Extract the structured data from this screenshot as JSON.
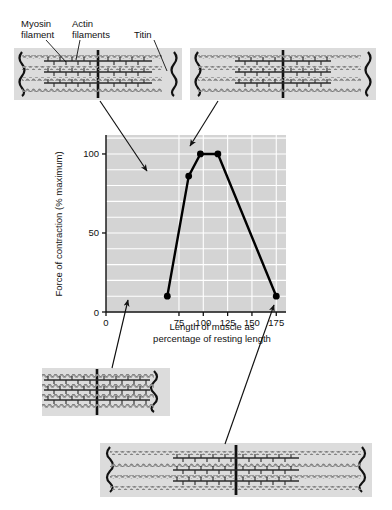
{
  "figure": {
    "labels": {
      "myosin": "Myosin\nfilament",
      "actin": "Actin\nfilaments",
      "titin": "Titin"
    }
  },
  "chart_data": {
    "type": "line",
    "title": "",
    "xlabel": "Length of muscle as\npercentage of resting length",
    "ylabel": "Force of contraction (% maximum)",
    "xlabel_line1": "Length of muscle as",
    "xlabel_line2": "percentage of resting length",
    "xlim": [
      0,
      185
    ],
    "ylim": [
      0,
      112
    ],
    "xticks": [
      0,
      75,
      100,
      125,
      150,
      175
    ],
    "xtick_labels": [
      "0",
      "75",
      "100",
      "125",
      "150",
      "175"
    ],
    "yticks": [
      0,
      50,
      100
    ],
    "ytick_labels": [
      "0",
      "50",
      "100"
    ],
    "grid": true,
    "legend": "none",
    "x": [
      63,
      85,
      97,
      115,
      175
    ],
    "values": [
      10,
      86,
      100,
      100,
      10
    ],
    "series": [
      {
        "name": "Force of contraction",
        "x": [
          63,
          85,
          97,
          115,
          175
        ],
        "values": [
          10,
          86,
          100,
          100,
          10
        ],
        "marker": "filled-circle",
        "color": "#000000"
      }
    ]
  },
  "sarcomeres": [
    {
      "name": "sarcomere-top-left",
      "state": "overlapped-short",
      "points_to": {
        "x": 85,
        "y": 86
      }
    },
    {
      "name": "sarcomere-top-right",
      "state": "optimal-overlap",
      "points_to": {
        "x": 104,
        "y": 100
      }
    },
    {
      "name": "sarcomere-bottom-left",
      "state": "fully-compressed",
      "points_to": {
        "x": 63,
        "y": 10
      }
    },
    {
      "name": "sarcomere-bottom-right",
      "state": "over-stretched",
      "points_to": {
        "x": 175,
        "y": 10
      }
    }
  ],
  "colors": {
    "plot_background": "#d4d4d4",
    "gridline": "#ffffff",
    "line": "#000000",
    "sarcomere_background": "#dcdcdc",
    "filament": "#8a8a8a"
  }
}
